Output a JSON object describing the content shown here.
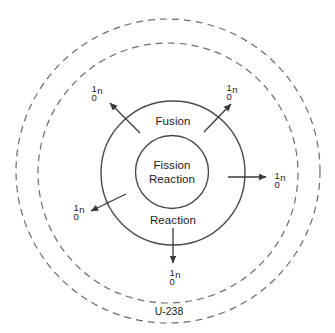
{
  "diagram": {
    "background_color": "#ffffff",
    "stroke_color": "#4a4a4a",
    "text_color": "#1a1a1a",
    "center": {
      "x": 173,
      "y": 173
    },
    "circles": {
      "inner_solid": {
        "label": "fission-reaction-core",
        "radius": 36,
        "style": "solid"
      },
      "middle_solid": {
        "label": "fusion-reaction-shell",
        "radius": 72,
        "style": "solid"
      },
      "inner_dashed": {
        "label": "inner-boundary",
        "radius": 130,
        "style": "dashed"
      },
      "outer_dashed": {
        "label": "outer-boundary",
        "radius": 152,
        "style": "dashed"
      }
    },
    "core": {
      "line1": "Fission",
      "line2": "Reaction"
    },
    "shell": {
      "top_label": "Fusion",
      "bottom_label": "Reaction"
    },
    "outer_material": "U-238",
    "neutron": {
      "mass_number": "1",
      "atomic_number": "0",
      "symbol": "n"
    },
    "emissions": [
      {
        "id": "neutron-top-left",
        "direction": "up-left",
        "label_x": 97,
        "label_y": 93
      },
      {
        "id": "neutron-top-right",
        "direction": "up-right",
        "label_x": 232,
        "label_y": 92
      },
      {
        "id": "neutron-right",
        "direction": "right",
        "label_x": 278,
        "label_y": 180
      },
      {
        "id": "neutron-bottom-left",
        "direction": "down-left",
        "label_x": 79,
        "label_y": 212
      },
      {
        "id": "neutron-bottom",
        "direction": "down",
        "label_x": 173,
        "label_y": 277
      }
    ]
  }
}
